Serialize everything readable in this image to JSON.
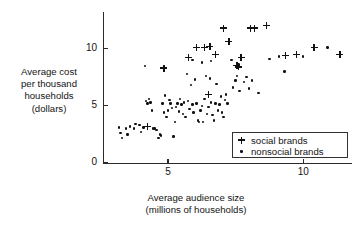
{
  "chart_data": {
    "type": "scatter",
    "title": "",
    "xlabel": "Average audience size (millions of households)",
    "xlabel_line1": "Average audience size",
    "xlabel_line2": "(millions of households)",
    "ylabel": "Average cost per thousand households (dollars)",
    "ylabel_line1": "Average cost",
    "ylabel_line2": "per thousand",
    "ylabel_line3": "households",
    "ylabel_line4": "(dollars)",
    "grid": false,
    "legend_position": "lower-right",
    "xlim": [
      2.6,
      11.8
    ],
    "ylim": [
      0,
      13.2
    ],
    "xticks": [
      5,
      10
    ],
    "xtick_labels": [
      "5",
      "10"
    ],
    "yticks": [
      0,
      5,
      10
    ],
    "ytick_labels": [
      "0",
      "5",
      "10"
    ],
    "marker_color": "#111111",
    "series": [
      {
        "name": "social brands",
        "marker": "plus",
        "points": [
          [
            4.85,
            8.3
          ],
          [
            5.75,
            9.2
          ],
          [
            6.05,
            10.1
          ],
          [
            6.35,
            10.1
          ],
          [
            6.55,
            10.2
          ],
          [
            6.75,
            9.5
          ],
          [
            7.05,
            11.8
          ],
          [
            7.25,
            10.6
          ],
          [
            7.55,
            8.5
          ],
          [
            7.6,
            8.4
          ],
          [
            7.7,
            9.2
          ],
          [
            8.05,
            11.8
          ],
          [
            8.2,
            11.8
          ],
          [
            8.65,
            12.0
          ],
          [
            9.35,
            9.4
          ],
          [
            9.75,
            9.5
          ],
          [
            10.4,
            10.1
          ],
          [
            11.35,
            9.5
          ],
          [
            4.25,
            3.2
          ],
          [
            6.5,
            6.0
          ]
        ]
      },
      {
        "name": "nonsocial brands",
        "marker": "dot",
        "points": [
          [
            3.2,
            3.1
          ],
          [
            3.25,
            2.6
          ],
          [
            3.3,
            2.2
          ],
          [
            3.45,
            3.0
          ],
          [
            3.5,
            2.5
          ],
          [
            3.6,
            3.2
          ],
          [
            3.75,
            3.0
          ],
          [
            3.8,
            3.4
          ],
          [
            3.95,
            3.3
          ],
          [
            4.0,
            2.7
          ],
          [
            4.1,
            3.1
          ],
          [
            4.15,
            8.5
          ],
          [
            4.2,
            5.4
          ],
          [
            4.25,
            5.2
          ],
          [
            4.3,
            5.6
          ],
          [
            4.35,
            5.3
          ],
          [
            4.4,
            4.6
          ],
          [
            4.45,
            3.0
          ],
          [
            4.5,
            3.0
          ],
          [
            4.55,
            2.9
          ],
          [
            4.6,
            2.9
          ],
          [
            4.65,
            2.2
          ],
          [
            4.7,
            2.5
          ],
          [
            4.75,
            2.4
          ],
          [
            4.8,
            5.2
          ],
          [
            4.85,
            4.4
          ],
          [
            4.9,
            5.9
          ],
          [
            4.95,
            4.0
          ],
          [
            5.0,
            4.6
          ],
          [
            5.05,
            5.5
          ],
          [
            5.1,
            5.2
          ],
          [
            5.15,
            4.8
          ],
          [
            5.2,
            2.3
          ],
          [
            5.25,
            3.6
          ],
          [
            5.3,
            4.9
          ],
          [
            5.35,
            5.2
          ],
          [
            5.4,
            4.5
          ],
          [
            5.45,
            5.6
          ],
          [
            5.5,
            5.1
          ],
          [
            5.55,
            4.3
          ],
          [
            5.6,
            5.3
          ],
          [
            5.65,
            4.0
          ],
          [
            5.7,
            7.8
          ],
          [
            5.75,
            5.4
          ],
          [
            5.8,
            4.7
          ],
          [
            5.85,
            6.8
          ],
          [
            5.9,
            5.1
          ],
          [
            5.95,
            4.4
          ],
          [
            6.0,
            7.3
          ],
          [
            6.05,
            5.2
          ],
          [
            6.1,
            3.7
          ],
          [
            6.15,
            3.6
          ],
          [
            6.2,
            4.6
          ],
          [
            6.25,
            5.0
          ],
          [
            6.3,
            3.6
          ],
          [
            6.35,
            5.6
          ],
          [
            6.4,
            7.6
          ],
          [
            6.45,
            4.3
          ],
          [
            6.5,
            4.9
          ],
          [
            6.55,
            7.4
          ],
          [
            6.6,
            5.3
          ],
          [
            6.65,
            4.2
          ],
          [
            6.7,
            3.7
          ],
          [
            6.75,
            5.2
          ],
          [
            6.8,
            6.9
          ],
          [
            6.85,
            4.6
          ],
          [
            6.9,
            5.1
          ],
          [
            6.95,
            5.8
          ],
          [
            7.0,
            4.4
          ],
          [
            7.05,
            4.0
          ],
          [
            7.1,
            5.5
          ],
          [
            7.15,
            6.0
          ],
          [
            7.2,
            5.2
          ],
          [
            7.4,
            6.6
          ],
          [
            7.5,
            7.2
          ],
          [
            7.55,
            7.6
          ],
          [
            7.6,
            8.6
          ],
          [
            7.65,
            6.3
          ],
          [
            7.8,
            7.1
          ],
          [
            7.9,
            7.5
          ],
          [
            8.0,
            6.5
          ],
          [
            8.1,
            7.2
          ],
          [
            8.35,
            6.1
          ],
          [
            9.1,
            9.3
          ],
          [
            9.3,
            8.0
          ],
          [
            10.0,
            9.3
          ],
          [
            10.9,
            10.1
          ],
          [
            6.6,
            8.9
          ],
          [
            5.9,
            9.0
          ],
          [
            6.25,
            8.8
          ],
          [
            7.35,
            9.0
          ],
          [
            8.75,
            9.1
          ]
        ]
      }
    ]
  },
  "legend": {
    "entries": [
      {
        "label": "social brands",
        "symbol": "plus"
      },
      {
        "label": "nonsocial brands",
        "symbol": "dot"
      }
    ]
  }
}
